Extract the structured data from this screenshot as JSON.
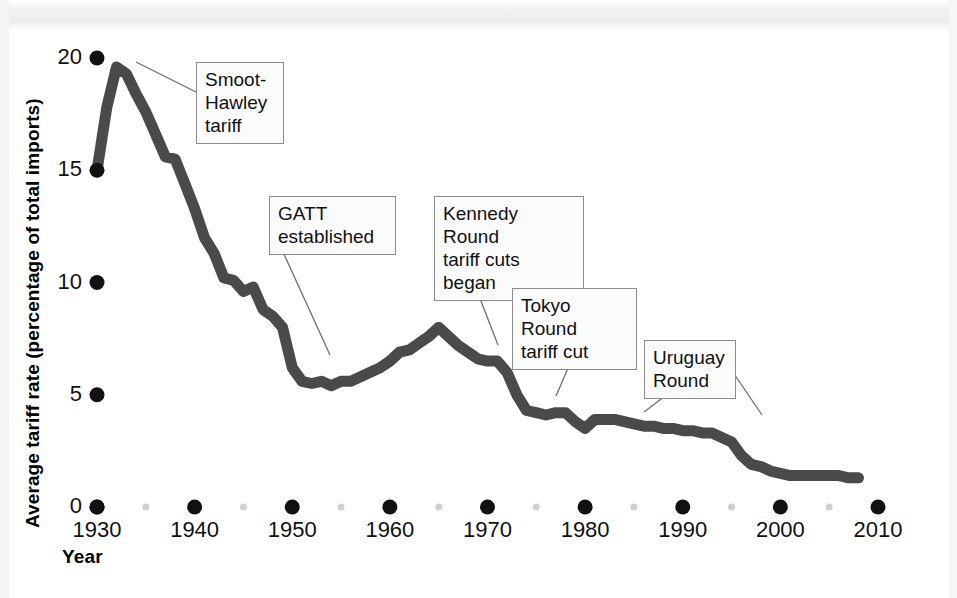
{
  "figure": {
    "background_color": "#ffffff",
    "series_color": "#4a4a4a",
    "tick_color": "#111111",
    "minor_tick_color": "#cfcfcf",
    "callout_border_color": "#8c8c8c",
    "callout_fill_color": "#fbfbfb"
  },
  "chart_data": {
    "type": "line",
    "title": "",
    "xlabel": "Year",
    "ylabel": "Average tariff rate (percentage of total imports)",
    "xlim": [
      1930,
      2010
    ],
    "ylim": [
      0,
      20
    ],
    "grid": false,
    "legend": "none",
    "xticks": [
      1930,
      1940,
      1950,
      1960,
      1970,
      1980,
      1990,
      2000,
      2010
    ],
    "xtick_labels": [
      "1930",
      "1940",
      "1950",
      "1960",
      "1970",
      "1980",
      "1990",
      "2000",
      "2010"
    ],
    "xminor_ticks": [
      1935,
      1945,
      1955,
      1965,
      1975,
      1985,
      1995,
      2005
    ],
    "yticks": [
      0,
      5,
      10,
      15,
      20
    ],
    "ytick_labels": [
      "0",
      "5",
      "10",
      "15",
      "20"
    ],
    "series": [
      {
        "name": "Average tariff rate",
        "x": [
          1930,
          1931,
          1932,
          1933,
          1934,
          1935,
          1936,
          1937,
          1938,
          1939,
          1940,
          1941,
          1942,
          1943,
          1944,
          1945,
          1946,
          1947,
          1948,
          1949,
          1950,
          1951,
          1952,
          1953,
          1954,
          1955,
          1956,
          1957,
          1958,
          1959,
          1960,
          1961,
          1962,
          1963,
          1964,
          1965,
          1966,
          1967,
          1968,
          1969,
          1970,
          1971,
          1972,
          1973,
          1974,
          1975,
          1976,
          1977,
          1978,
          1979,
          1980,
          1981,
          1982,
          1983,
          1984,
          1985,
          1986,
          1987,
          1988,
          1989,
          1990,
          1991,
          1992,
          1993,
          1994,
          1995,
          1996,
          1997,
          1998,
          1999,
          2000,
          2001,
          2002,
          2003,
          2004,
          2005,
          2006,
          2007,
          2008
        ],
        "values": [
          15.0,
          17.8,
          19.6,
          19.3,
          18.4,
          17.6,
          16.6,
          15.6,
          15.5,
          14.4,
          13.3,
          12.0,
          11.3,
          10.2,
          10.1,
          9.6,
          9.8,
          8.8,
          8.5,
          8.0,
          6.2,
          5.6,
          5.5,
          5.6,
          5.4,
          5.6,
          5.6,
          5.8,
          6.0,
          6.2,
          6.5,
          6.9,
          7.0,
          7.3,
          7.6,
          8.0,
          7.6,
          7.2,
          6.9,
          6.6,
          6.5,
          6.5,
          6.0,
          5.0,
          4.3,
          4.2,
          4.1,
          4.2,
          4.2,
          3.8,
          3.5,
          3.9,
          3.9,
          3.9,
          3.8,
          3.7,
          3.6,
          3.6,
          3.5,
          3.5,
          3.4,
          3.4,
          3.3,
          3.3,
          3.1,
          2.9,
          2.3,
          1.9,
          1.8,
          1.6,
          1.5,
          1.4,
          1.4,
          1.4,
          1.4,
          1.4,
          1.4,
          1.3,
          1.3
        ]
      }
    ],
    "annotations": [
      {
        "id": "smoot-hawley",
        "label": "Smoot-\nHawley\ntariff",
        "target_year": 1932,
        "target_value": 19.6
      },
      {
        "id": "gatt",
        "label": "GATT\nestablished",
        "target_year": 1947,
        "target_value": 8.8
      },
      {
        "id": "kennedy-round",
        "label": "Kennedy Round\ntariff cuts began",
        "target_year": 1967,
        "target_value": 7.2
      },
      {
        "id": "tokyo-round",
        "label": "Tokyo Round\ntariff cut",
        "target_year": 1979,
        "target_value": 3.8
      },
      {
        "id": "uruguay-round",
        "label": "Uruguay\nRound",
        "target_year": 1994,
        "target_value": 3.1
      }
    ]
  }
}
